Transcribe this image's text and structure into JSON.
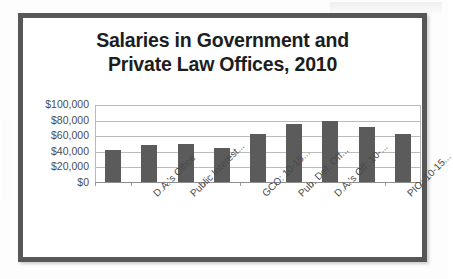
{
  "chart_data": {
    "type": "bar",
    "title": "Salaries in Government and Private Law Offices, 2010",
    "title_lines": [
      "Salaries in Government and",
      "Private Law Offices, 2010"
    ],
    "xlabel": "",
    "ylabel": "",
    "ylim": [
      0,
      100000
    ],
    "grid": true,
    "legend": false,
    "y_ticks": [
      100000,
      80000,
      60000,
      40000,
      20000,
      0
    ],
    "y_tick_labels": [
      "$100,000",
      "$80,000",
      "$60,000",
      "$40,000",
      "$20,000",
      "$0"
    ],
    "categories": [
      "",
      "D.A.'s Office",
      "Public Interest...",
      "",
      "GCO: 10-15...",
      "Pub. Def. Off...",
      "D.A.'s Off: 10-...",
      "",
      "PIO: 10-15..."
    ],
    "visible_x_tick_labels": [
      "D.A.'s Office",
      "Public Interest...",
      "GCO: 10-15...",
      "Pub. Def. Off...",
      "D.A.'s Off: 10-...",
      "PIO: 10-15..."
    ],
    "values": [
      41000,
      47000,
      49000,
      44000,
      62000,
      75000,
      78000,
      71000,
      61000
    ],
    "bar_color": "#5b5b5b"
  },
  "colors": {
    "frame": "#575757",
    "bar": "#5b5b5b",
    "grid": "#bcbcbc",
    "title_text": "#1d1d1d",
    "axis_text": "#4a4a4a",
    "background": "#ffffff"
  }
}
